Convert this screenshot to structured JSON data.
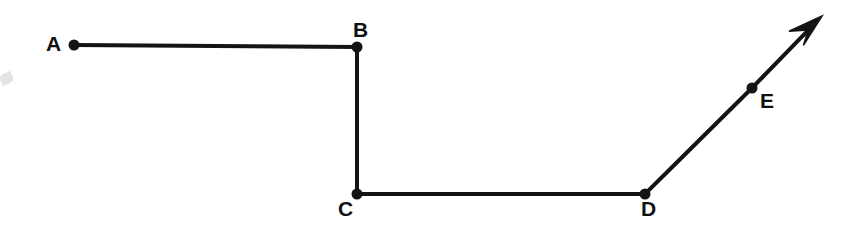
{
  "figure": {
    "type": "polyline-with-arrow",
    "canvas": {
      "width": 860,
      "height": 229
    },
    "colors": {
      "background": "#ffffff",
      "stroke": "#141414",
      "label": "#111111",
      "smudge": "#d9dadc"
    },
    "stroke_width": 4,
    "dot_radius": 5.5,
    "points": [
      {
        "id": "A",
        "label": "A",
        "x": 74,
        "y": 45,
        "label_x": 46,
        "label_y": 33,
        "label_position": "left"
      },
      {
        "id": "B",
        "label": "B",
        "x": 357,
        "y": 47,
        "label_x": 353,
        "label_y": 19,
        "label_position": "above"
      },
      {
        "id": "C",
        "label": "C",
        "x": 357,
        "y": 194,
        "label_x": 338,
        "label_y": 198,
        "label_position": "below-left"
      },
      {
        "id": "D",
        "label": "D",
        "x": 645,
        "y": 194,
        "label_x": 641,
        "label_y": 198,
        "label_position": "below"
      },
      {
        "id": "E",
        "label": "E",
        "x": 752,
        "y": 88,
        "label_x": 760,
        "label_y": 90,
        "label_position": "right"
      }
    ],
    "segments": [
      {
        "from": "A",
        "to": "B",
        "orientation": "horizontal"
      },
      {
        "from": "B",
        "to": "C",
        "orientation": "vertical"
      },
      {
        "from": "C",
        "to": "D",
        "orientation": "horizontal"
      },
      {
        "from": "D",
        "to": "E",
        "orientation": "diagonal-up-right"
      }
    ],
    "arrow": {
      "present": true,
      "from": "E",
      "tip_x": 822,
      "tip_y": 16,
      "direction": "up-right",
      "head_length": 34,
      "head_width": 26
    },
    "artifacts": [
      {
        "name": "scan-smudge",
        "x": 0,
        "y": 73,
        "width": 13,
        "height": 11
      }
    ],
    "path_data": "M 74 45 L 357 47 L 357 194 L 645 194 L 752 88 L 805 35",
    "arrow_head_points": "822,16 789,33 797,41 790,49"
  }
}
